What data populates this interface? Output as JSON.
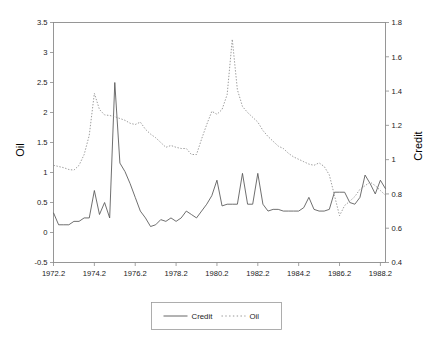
{
  "chart_data": {
    "type": "line",
    "title": "",
    "subtitle": "",
    "xlabel": "",
    "ylabel": "Oil",
    "y2label": "Credit",
    "grid": false,
    "legend_position": "bottom",
    "xlim": [
      1972.2,
      1988.45
    ],
    "ylim": [
      -0.5,
      3.5
    ],
    "y2lim": [
      0.4,
      1.8
    ],
    "xticks": [
      "1972.2",
      "1974.2",
      "1976.2",
      "1978.2",
      "1980.2",
      "1982.2",
      "1984.2",
      "1986.2",
      "1988.2"
    ],
    "xtick_values": [
      1972.2,
      1974.2,
      1976.2,
      1978.2,
      1980.2,
      1982.2,
      1984.2,
      1986.2,
      1988.2
    ],
    "yticks": [
      "-0.5",
      "0",
      "0.5",
      "1",
      "1.5",
      "2",
      "2.5",
      "3",
      "3.5"
    ],
    "ytick_values": [
      -0.5,
      0,
      0.5,
      1,
      1.5,
      2,
      2.5,
      3,
      3.5
    ],
    "y2ticks": [
      "0.4",
      "0.6",
      "0.8",
      "1",
      "1.2",
      "1.4",
      "1.6",
      "1.8"
    ],
    "y2tick_values": [
      0.4,
      0.6,
      0.8,
      1.0,
      1.2,
      1.4,
      1.6,
      1.8
    ],
    "colors": {
      "credit": "#555555",
      "oil": "#8a8a8a",
      "frame": "#8c8c8c"
    },
    "series": [
      {
        "name": "Credit",
        "axis": "right",
        "style": "solid",
        "x": [
          1972.2,
          1972.45,
          1972.7,
          1972.95,
          1973.2,
          1973.45,
          1973.7,
          1973.95,
          1974.2,
          1974.45,
          1974.7,
          1974.95,
          1975.2,
          1975.45,
          1975.7,
          1975.95,
          1976.2,
          1976.45,
          1976.7,
          1976.95,
          1977.2,
          1977.45,
          1977.7,
          1977.95,
          1978.2,
          1978.45,
          1978.7,
          1978.95,
          1979.2,
          1979.45,
          1979.7,
          1979.95,
          1980.2,
          1980.45,
          1980.7,
          1980.95,
          1981.2,
          1981.45,
          1981.7,
          1981.95,
          1982.2,
          1982.45,
          1982.7,
          1982.95,
          1983.2,
          1983.45,
          1983.7,
          1983.95,
          1984.2,
          1984.45,
          1984.7,
          1984.95,
          1985.2,
          1985.45,
          1985.7,
          1985.95,
          1986.2,
          1986.45,
          1986.7,
          1986.95,
          1987.2,
          1987.45,
          1987.7,
          1987.95,
          1988.2,
          1988.45
        ],
        "values": [
          0.69,
          0.62,
          0.62,
          0.62,
          0.64,
          0.64,
          0.66,
          0.66,
          0.82,
          0.68,
          0.75,
          0.66,
          1.45,
          0.98,
          0.93,
          0.86,
          0.78,
          0.7,
          0.66,
          0.61,
          0.62,
          0.65,
          0.64,
          0.66,
          0.64,
          0.66,
          0.7,
          0.68,
          0.66,
          0.7,
          0.74,
          0.79,
          0.88,
          0.73,
          0.74,
          0.74,
          0.74,
          0.92,
          0.74,
          0.74,
          0.92,
          0.74,
          0.7,
          0.71,
          0.71,
          0.7,
          0.7,
          0.7,
          0.7,
          0.72,
          0.78,
          0.71,
          0.7,
          0.7,
          0.71,
          0.81,
          0.81,
          0.81,
          0.75,
          0.74,
          0.78,
          0.91,
          0.86,
          0.8,
          0.88,
          0.83
        ]
      },
      {
        "name": "Oil",
        "axis": "left",
        "style": "dotted",
        "x": [
          1972.2,
          1972.45,
          1972.7,
          1972.95,
          1973.2,
          1973.45,
          1973.7,
          1973.95,
          1974.2,
          1974.45,
          1974.7,
          1974.95,
          1975.2,
          1975.45,
          1975.7,
          1975.95,
          1976.2,
          1976.45,
          1976.7,
          1976.95,
          1977.2,
          1977.45,
          1977.7,
          1977.95,
          1978.2,
          1978.45,
          1978.7,
          1978.95,
          1979.2,
          1979.45,
          1979.7,
          1979.95,
          1980.2,
          1980.45,
          1980.7,
          1980.95,
          1981.2,
          1981.45,
          1981.7,
          1981.95,
          1982.2,
          1982.45,
          1982.7,
          1982.95,
          1983.2,
          1983.45,
          1983.7,
          1983.95,
          1984.2,
          1984.45,
          1984.7,
          1984.95,
          1985.2,
          1985.45,
          1985.7,
          1985.95,
          1986.2,
          1986.45,
          1986.7,
          1986.95,
          1987.2,
          1987.45,
          1987.7,
          1987.95,
          1988.2,
          1988.45
        ],
        "values": [
          1.12,
          1.1,
          1.08,
          1.05,
          1.04,
          1.12,
          1.3,
          1.62,
          2.32,
          2.05,
          1.96,
          1.95,
          1.93,
          1.9,
          1.87,
          1.82,
          1.8,
          1.84,
          1.72,
          1.64,
          1.58,
          1.5,
          1.42,
          1.45,
          1.42,
          1.4,
          1.4,
          1.3,
          1.3,
          1.56,
          1.8,
          2.02,
          1.97,
          2.05,
          2.3,
          3.22,
          2.38,
          2.1,
          2.0,
          1.92,
          1.84,
          1.7,
          1.6,
          1.52,
          1.44,
          1.4,
          1.32,
          1.26,
          1.22,
          1.18,
          1.14,
          1.12,
          1.16,
          1.1,
          0.96,
          0.62,
          0.28,
          0.45,
          0.52,
          0.6,
          0.72,
          0.78,
          0.84,
          0.78,
          0.7,
          0.62
        ]
      }
    ]
  },
  "legend": {
    "items": [
      {
        "label": "Credit",
        "style": "solid"
      },
      {
        "label": "Oil",
        "style": "dotted"
      }
    ]
  }
}
